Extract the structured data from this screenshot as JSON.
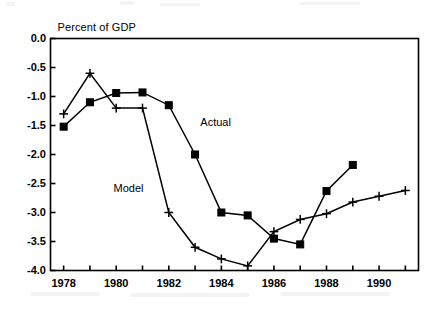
{
  "chart_data": {
    "type": "line",
    "title": "",
    "ylabel": "Percent of GDP",
    "xlabel": "",
    "x": [
      1978,
      1979,
      1980,
      1981,
      1982,
      1983,
      1984,
      1985,
      1986,
      1987,
      1988,
      1989,
      1990,
      1991
    ],
    "xlim": [
      1977.5,
      1991.5
    ],
    "ylim": [
      -4.0,
      0.0
    ],
    "yticks": [
      "0.0",
      "-0.5",
      "-1.0",
      "-1.5",
      "-2.0",
      "-2.5",
      "-3.0",
      "-3.5",
      "-4.0"
    ],
    "ytick_values": [
      0.0,
      -0.5,
      -1.0,
      -1.5,
      -2.0,
      -2.5,
      -3.0,
      -3.5,
      -4.0
    ],
    "xticks": [
      "1978",
      "1980",
      "1982",
      "1984",
      "1986",
      "1988",
      "1990"
    ],
    "xtick_values": [
      1978,
      1980,
      1982,
      1984,
      1986,
      1988,
      1990
    ],
    "xtick_minor_values": [
      1979,
      1981,
      1983,
      1985,
      1987,
      1989,
      1991
    ],
    "grid": false,
    "legend_position": "inline-annotations",
    "series": [
      {
        "name": "Model",
        "marker": "plus",
        "color": "#000000",
        "label_x": 1979.9,
        "label_y": -2.62,
        "x": [
          1978,
          1979,
          1980,
          1981,
          1982,
          1983,
          1984,
          1985,
          1986,
          1987,
          1988,
          1989,
          1990,
          1991
        ],
        "values": [
          -1.3,
          -0.6,
          -1.2,
          -1.2,
          -3.0,
          -3.6,
          -3.8,
          -3.92,
          -3.33,
          -3.12,
          -3.02,
          -2.82,
          -2.72,
          -2.62
        ]
      },
      {
        "name": "Actual",
        "marker": "square",
        "color": "#000000",
        "label_x": 1983.2,
        "label_y": -1.48,
        "x": [
          1978,
          1979,
          1980,
          1981,
          1982,
          1983,
          1984,
          1985,
          1986,
          1987,
          1988,
          1989
        ],
        "values": [
          -1.52,
          -1.1,
          -0.94,
          -0.93,
          -1.15,
          -2.0,
          -3.0,
          -3.05,
          -3.45,
          -3.55,
          -2.63,
          -2.18
        ]
      }
    ]
  }
}
